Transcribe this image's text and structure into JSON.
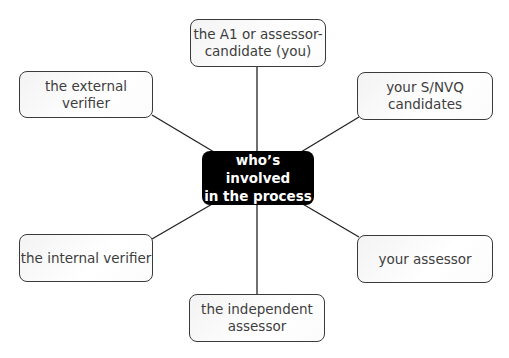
{
  "diagram": {
    "type": "hub-and-spoke",
    "center": {
      "label": "who’s involved\nin the process"
    },
    "nodes": [
      {
        "id": "top",
        "label": "the A1 or assessor-\ncandidate (you)"
      },
      {
        "id": "upper-left",
        "label": "the external verifier"
      },
      {
        "id": "upper-right",
        "label": "your S/NVQ\ncandidates"
      },
      {
        "id": "lower-left",
        "label": "the internal verifier"
      },
      {
        "id": "lower-right",
        "label": "your assessor"
      },
      {
        "id": "bottom",
        "label": "the independent\nassessor"
      }
    ]
  },
  "colors": {
    "center_fill": "#000000",
    "center_text": "#ffffff",
    "node_border": "#3a3a3a",
    "node_text": "#3d3d3d",
    "connector": "#222222"
  }
}
